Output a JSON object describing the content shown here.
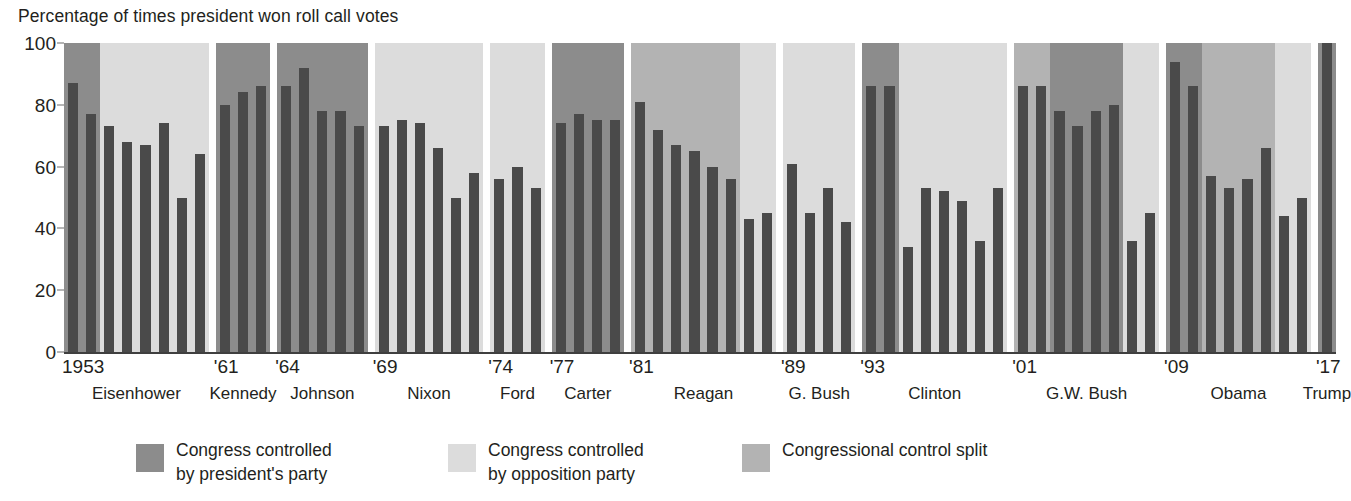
{
  "chart_data": {
    "type": "bar",
    "title": "Percentage of times president won roll call votes",
    "xlabel": "",
    "ylabel": "",
    "ylim": [
      0,
      100
    ],
    "yticks": [
      0,
      20,
      40,
      60,
      80,
      100
    ],
    "grid": false,
    "legend_position": "bottom",
    "colors": {
      "bar": "#4a4a4a",
      "president_party": "#8c8c8c",
      "opposition_party": "#dcdcdc",
      "control_split": "#b3b3b3",
      "background": "#ffffff",
      "text": "#231f20"
    },
    "legend": [
      {
        "key": "president_party",
        "label": "Congress controlled\nby president's party",
        "color": "#8c8c8c"
      },
      {
        "key": "opposition_party",
        "label": "Congress controlled\nby opposition party",
        "color": "#dcdcdc"
      },
      {
        "key": "control_split",
        "label": "Congressional control split",
        "color": "#b3b3b3"
      }
    ],
    "x_tick_labels": [
      "1953",
      "'61",
      "'64",
      "'69",
      "'74",
      "'77",
      "'81",
      "'89",
      "'93",
      "'01",
      "'09",
      "'17"
    ],
    "presidents": [
      {
        "name": "Eisenhower",
        "start_year": 1953,
        "x_tick": "1953",
        "years": [
          1953,
          1954,
          1955,
          1956,
          1957,
          1958,
          1959,
          1960
        ],
        "values": [
          87,
          77,
          73,
          68,
          67,
          74,
          50,
          64
        ],
        "control": [
          "president_party",
          "president_party",
          "opposition_party",
          "opposition_party",
          "opposition_party",
          "opposition_party",
          "opposition_party",
          "opposition_party"
        ]
      },
      {
        "name": "Kennedy",
        "start_year": 1961,
        "x_tick": "'61",
        "years": [
          1961,
          1962,
          1963
        ],
        "values": [
          80,
          84,
          86
        ],
        "control": [
          "president_party",
          "president_party",
          "president_party"
        ]
      },
      {
        "name": "Johnson",
        "start_year": 1964,
        "x_tick": "'64",
        "years": [
          1964,
          1965,
          1966,
          1967,
          1968
        ],
        "values": [
          86,
          92,
          78,
          78,
          73
        ],
        "control": [
          "president_party",
          "president_party",
          "president_party",
          "president_party",
          "president_party"
        ]
      },
      {
        "name": "Nixon",
        "start_year": 1969,
        "x_tick": "'69",
        "years": [
          1969,
          1970,
          1971,
          1972,
          1973,
          1974
        ],
        "values": [
          73,
          75,
          74,
          66,
          50,
          58
        ],
        "control": [
          "opposition_party",
          "opposition_party",
          "opposition_party",
          "opposition_party",
          "opposition_party",
          "opposition_party"
        ]
      },
      {
        "name": "Ford",
        "start_year": 1974,
        "x_tick": "'74",
        "years": [
          1974,
          1975,
          1976
        ],
        "values": [
          56,
          60,
          53
        ],
        "control": [
          "opposition_party",
          "opposition_party",
          "opposition_party"
        ]
      },
      {
        "name": "Carter",
        "start_year": 1977,
        "x_tick": "'77",
        "years": [
          1977,
          1978,
          1979,
          1980
        ],
        "values": [
          74,
          77,
          75,
          75
        ],
        "control": [
          "president_party",
          "president_party",
          "president_party",
          "president_party"
        ]
      },
      {
        "name": "Reagan",
        "start_year": 1981,
        "x_tick": "'81",
        "years": [
          1981,
          1982,
          1983,
          1984,
          1985,
          1986,
          1987,
          1988
        ],
        "values": [
          81,
          72,
          67,
          65,
          60,
          56,
          43,
          45
        ],
        "control": [
          "control_split",
          "control_split",
          "control_split",
          "control_split",
          "control_split",
          "control_split",
          "opposition_party",
          "opposition_party"
        ]
      },
      {
        "name": "G. Bush",
        "start_year": 1989,
        "x_tick": "'89",
        "years": [
          1989,
          1990,
          1991,
          1992
        ],
        "values": [
          61,
          45,
          53,
          42
        ],
        "control": [
          "opposition_party",
          "opposition_party",
          "opposition_party",
          "opposition_party"
        ]
      },
      {
        "name": "Clinton",
        "start_year": 1993,
        "x_tick": "'93",
        "years": [
          1993,
          1994,
          1995,
          1996,
          1997,
          1998,
          1999,
          2000
        ],
        "values": [
          86,
          86,
          34,
          53,
          52,
          49,
          36,
          53
        ],
        "control": [
          "president_party",
          "president_party",
          "opposition_party",
          "opposition_party",
          "opposition_party",
          "opposition_party",
          "opposition_party",
          "opposition_party"
        ]
      },
      {
        "name": "G.W. Bush",
        "start_year": 2001,
        "x_tick": "'01",
        "years": [
          2001,
          2002,
          2003,
          2004,
          2005,
          2006,
          2007,
          2008
        ],
        "values": [
          86,
          86,
          78,
          73,
          78,
          80,
          36,
          45
        ],
        "control": [
          "control_split",
          "control_split",
          "president_party",
          "president_party",
          "president_party",
          "president_party",
          "opposition_party",
          "opposition_party"
        ]
      },
      {
        "name": "Obama",
        "start_year": 2009,
        "x_tick": "'09",
        "years": [
          2009,
          2010,
          2011,
          2012,
          2013,
          2014,
          2015,
          2016
        ],
        "values": [
          94,
          86,
          57,
          53,
          56,
          66,
          44,
          50
        ],
        "control": [
          "president_party",
          "president_party",
          "control_split",
          "control_split",
          "control_split",
          "control_split",
          "opposition_party",
          "opposition_party"
        ]
      },
      {
        "name": "Trump",
        "start_year": 2017,
        "x_tick": "'17",
        "years": [
          2017
        ],
        "values": [
          100
        ],
        "control": [
          "president_party"
        ]
      }
    ]
  }
}
